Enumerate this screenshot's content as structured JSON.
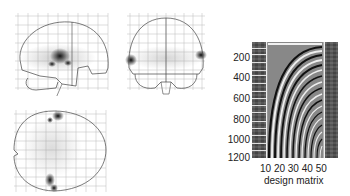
{
  "figure": {
    "panels": [
      {
        "name": "sagittal-glass-brain",
        "view": "sagittal"
      },
      {
        "name": "coronal-glass-brain",
        "view": "coronal"
      },
      {
        "name": "axial-glass-brain",
        "view": "axial"
      }
    ],
    "design_matrix": {
      "xlabel": "design matrix",
      "x_ticks": [
        "10",
        "20",
        "30",
        "40",
        "50"
      ],
      "y_ticks": [
        "200",
        "400",
        "600",
        "800",
        "1000",
        "1200"
      ],
      "colors": {
        "dark": "#111111",
        "light": "#f4f4f4",
        "mid": "#777777"
      }
    }
  }
}
